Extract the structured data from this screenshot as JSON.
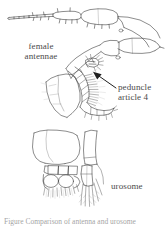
{
  "figure": {
    "width": 166,
    "height": 226,
    "background_color": "#ffffff",
    "ink_color": "#3a3a3a",
    "text_color": "#4a4a4a",
    "style": "scanned scientific line drawing"
  },
  "labels": {
    "female_antennae_line1": "female",
    "female_antennae_line2": "antennae",
    "peduncle_line1": "peduncle",
    "peduncle_line2": "article 4",
    "urosome": "urosome"
  },
  "caption": {
    "clipped_text": "Figure  Comparison of antenna and urosome"
  },
  "annotations": {
    "arrow_label": "arrow-to-peduncle-article-4"
  }
}
